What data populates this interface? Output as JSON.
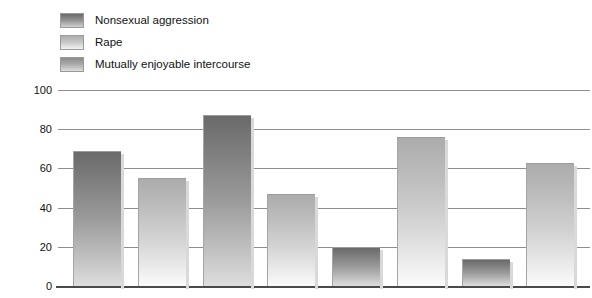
{
  "legend": {
    "items": [
      {
        "label": "Nonsexual aggression",
        "swatch": "dark-gradient-swatch"
      },
      {
        "label": "Rape",
        "swatch": "light-gradient-swatch"
      },
      {
        "label": "Mutually enjoyable intercourse",
        "swatch": "mid-gradient-swatch"
      }
    ]
  },
  "axes": {
    "y_title": "Percentage full erection",
    "y_ticks": [
      "100",
      "80",
      "60",
      "40",
      "20",
      "0"
    ]
  },
  "chart_data": {
    "type": "bar",
    "title": "",
    "xlabel": "",
    "ylabel": "Percentage full erection",
    "ylim": [
      0,
      100
    ],
    "yticks": [
      0,
      20,
      40,
      60,
      80,
      100
    ],
    "grid": true,
    "legend_position": "top-left",
    "categories": [
      "1",
      "2",
      "3",
      "4",
      "5",
      "6",
      "7",
      "8"
    ],
    "values": [
      69,
      55,
      87,
      47,
      20,
      76,
      14,
      63
    ],
    "bar_shades": [
      "dark",
      "light",
      "dark",
      "light",
      "dark",
      "light",
      "dark",
      "light"
    ],
    "series": [
      {
        "name": "Bars",
        "values": [
          69,
          55,
          87,
          47,
          20,
          76,
          14,
          63
        ]
      }
    ],
    "legend_entries": [
      "Nonsexual aggression",
      "Rape",
      "Mutually enjoyable intercourse"
    ]
  }
}
